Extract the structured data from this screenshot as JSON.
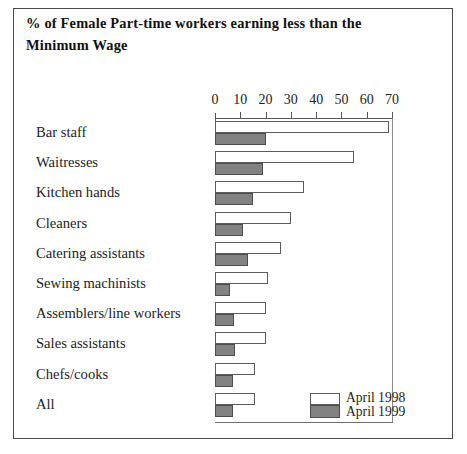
{
  "chart_data": {
    "type": "bar",
    "orientation": "horizontal",
    "title": "% of Female Part-time workers earning less than the Minimum Wage",
    "title_line1": "% of Female Part-time workers earning less than the",
    "title_line2": "Minimum Wage",
    "xlabel": "",
    "ylabel": "",
    "xlim": [
      0,
      70
    ],
    "xticks": [
      0,
      10,
      20,
      30,
      40,
      50,
      60,
      70
    ],
    "xtick_labels": [
      "0",
      "10",
      "20",
      "30",
      "40",
      "50",
      "60",
      "70"
    ],
    "grid": false,
    "legend_position": "bottom-right",
    "categories": [
      "Bar staff",
      "Waitresses",
      "Kitchen hands",
      "Cleaners",
      "Catering assistants",
      "Sewing machinists",
      "Assemblers/line workers",
      "Sales assistants",
      "Chefs/cooks",
      "All"
    ],
    "series": [
      {
        "name": "April 1998",
        "color": "#ffffff",
        "values": [
          69,
          55,
          35,
          30,
          26,
          21,
          20,
          20,
          16,
          16
        ]
      },
      {
        "name": "April 1999",
        "color": "#828282",
        "values": [
          20,
          19,
          15,
          11,
          13,
          6,
          7.5,
          8,
          7,
          7
        ]
      }
    ]
  },
  "legend": {
    "items": [
      {
        "label": "April 1998",
        "swatch": "white-swatch"
      },
      {
        "label": "April 1999",
        "swatch": "grey-swatch"
      }
    ]
  }
}
